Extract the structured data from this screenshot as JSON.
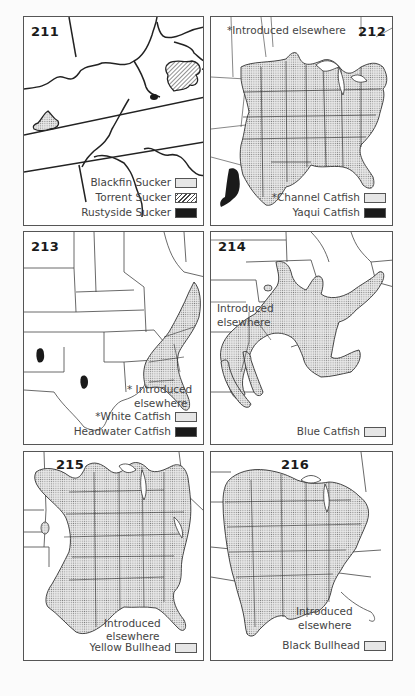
{
  "panels": [
    {
      "id": "211",
      "number": "211",
      "legend": [
        {
          "label": "Blackfin Sucker",
          "pattern": "stipple"
        },
        {
          "label": "Torrent Sucker",
          "pattern": "hatch"
        },
        {
          "label": "Rustyside Sucker",
          "pattern": "solid"
        }
      ]
    },
    {
      "id": "212",
      "number": "212",
      "note": "*Introduced elsewhere",
      "legend": [
        {
          "label": "*Channel Catfish",
          "pattern": "stipple"
        },
        {
          "label": "Yaqui Catfish",
          "pattern": "solid"
        }
      ]
    },
    {
      "id": "213",
      "number": "213",
      "note_line1": "* Introduced",
      "note_line2": "elsewhere",
      "legend": [
        {
          "label": "*White Catfish",
          "pattern": "stipple"
        },
        {
          "label": "Headwater Catfish",
          "pattern": "solid"
        }
      ]
    },
    {
      "id": "214",
      "number": "214",
      "note_line1": "Introduced",
      "note_line2": "elsewhere",
      "legend": [
        {
          "label": "Blue Catfish",
          "pattern": "stipple"
        }
      ]
    },
    {
      "id": "215",
      "number": "215",
      "note_line1": "Introduced",
      "note_line2": "elsewhere",
      "legend": [
        {
          "label": "Yellow Bullhead",
          "pattern": "stipple"
        }
      ]
    },
    {
      "id": "216",
      "number": "216",
      "note_line1": "Introduced",
      "note_line2": "elsewhere",
      "legend": [
        {
          "label": "Black Bullhead",
          "pattern": "stipple"
        }
      ]
    }
  ],
  "colors": {
    "stipple_fill": "#e6e6e6",
    "stipple_dot": "#8a8a8a",
    "solid_fill": "#1a1a1a",
    "border": "#555555",
    "line": "#222222"
  }
}
